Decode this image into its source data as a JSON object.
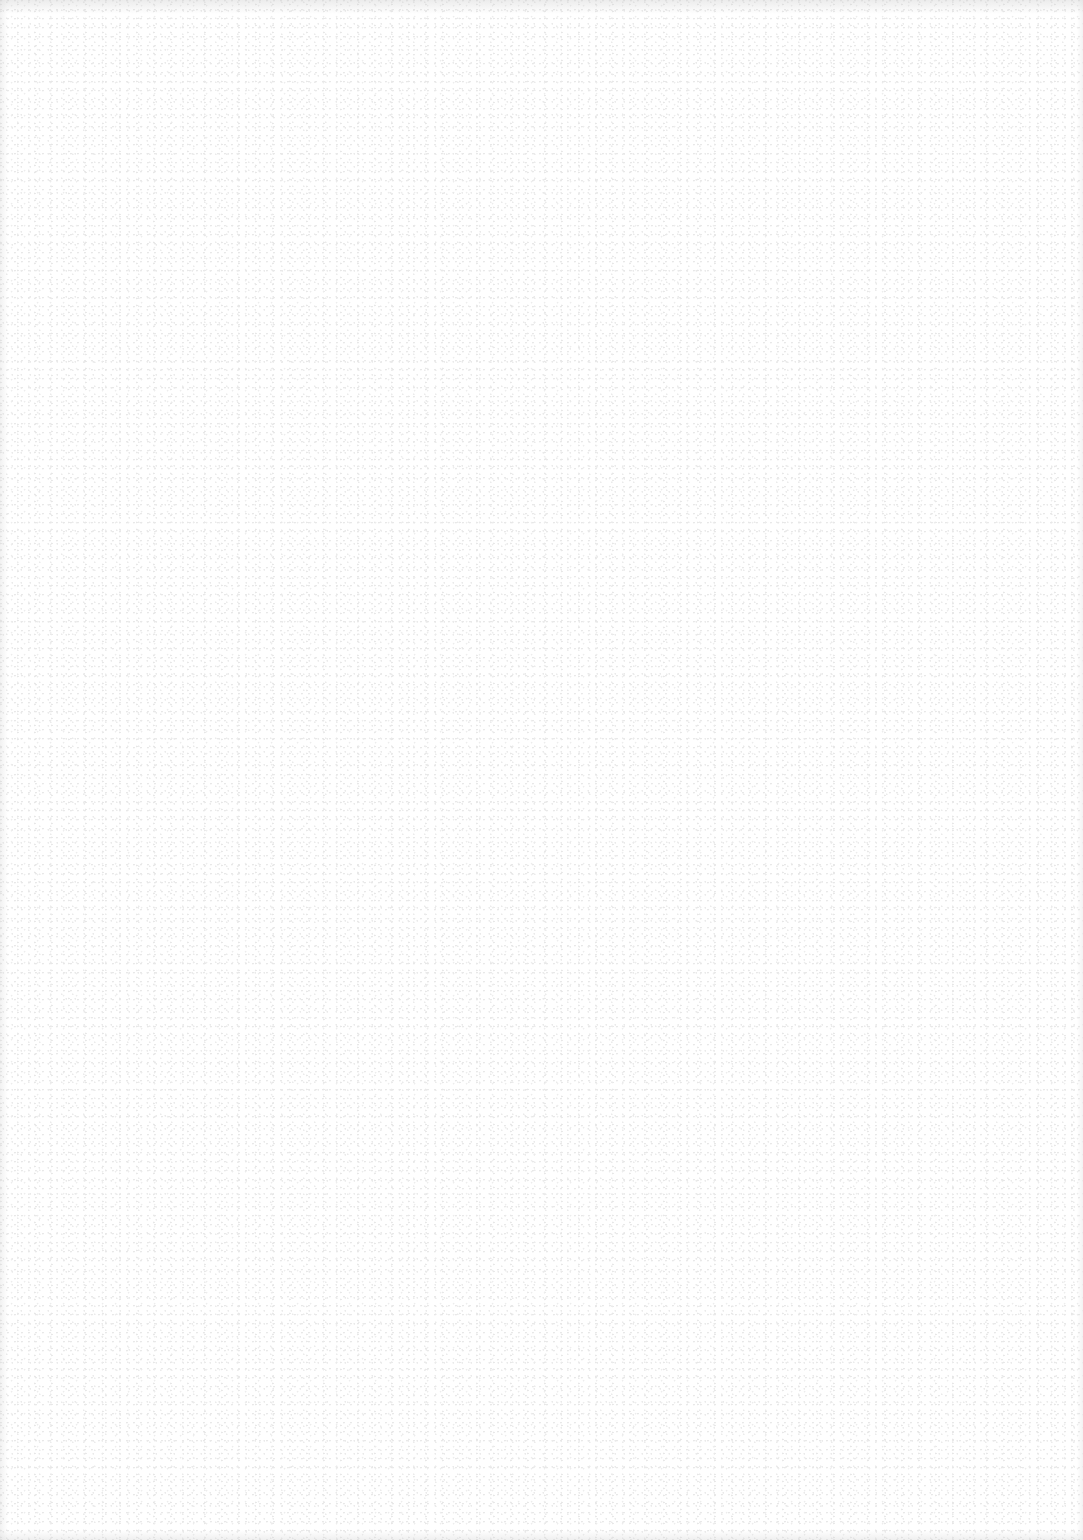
{
  "document": {
    "type": "blank-scanned-page",
    "background_color": "#ffffff",
    "noise_color": "#d8d8d8",
    "text_content": []
  }
}
